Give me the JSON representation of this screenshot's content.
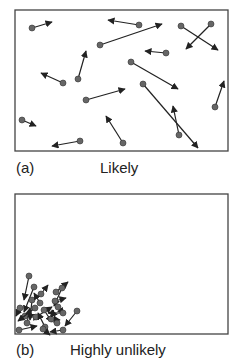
{
  "panels": [
    {
      "id": "a",
      "tag": "(a)",
      "caption": "Likely",
      "box": {
        "x": 15,
        "y": 10,
        "w": 213,
        "h": 141
      },
      "particles": [
        {
          "x": 32,
          "y": 28,
          "tx": 52,
          "ty": 22
        },
        {
          "x": 139,
          "y": 25,
          "tx": 108,
          "ty": 20
        },
        {
          "x": 100,
          "y": 45,
          "tx": 162,
          "ty": 24
        },
        {
          "x": 181,
          "y": 26,
          "tx": 218,
          "ty": 50
        },
        {
          "x": 211,
          "y": 24,
          "tx": 186,
          "ty": 49
        },
        {
          "x": 166,
          "y": 53,
          "tx": 145,
          "ty": 51
        },
        {
          "x": 78,
          "y": 79,
          "tx": 86,
          "ty": 51
        },
        {
          "x": 63,
          "y": 83,
          "tx": 41,
          "ty": 73
        },
        {
          "x": 131,
          "y": 62,
          "tx": 178,
          "ty": 89
        },
        {
          "x": 143,
          "y": 84,
          "tx": 198,
          "ty": 148
        },
        {
          "x": 86,
          "y": 100,
          "tx": 125,
          "ty": 89
        },
        {
          "x": 215,
          "y": 107,
          "tx": 224,
          "ty": 81
        },
        {
          "x": 22,
          "y": 120,
          "tx": 36,
          "ty": 126
        },
        {
          "x": 123,
          "y": 143,
          "tx": 106,
          "ty": 116
        },
        {
          "x": 179,
          "y": 135,
          "tx": 173,
          "ty": 106
        },
        {
          "x": 80,
          "y": 141,
          "tx": 52,
          "ty": 146
        }
      ]
    },
    {
      "id": "b",
      "tag": "(b)",
      "caption": "Highly unlikely",
      "box": {
        "x": 15,
        "y": 194,
        "w": 213,
        "h": 140
      },
      "particles": [
        {
          "x": 29,
          "y": 276,
          "tx": 24,
          "ty": 300
        },
        {
          "x": 34,
          "y": 287,
          "tx": 24,
          "ty": 312
        },
        {
          "x": 41,
          "y": 294,
          "tx": 48,
          "ty": 285
        },
        {
          "x": 32,
          "y": 300,
          "tx": 30,
          "ty": 320
        },
        {
          "x": 56,
          "y": 292,
          "tx": 68,
          "ty": 282
        },
        {
          "x": 62,
          "y": 288,
          "tx": 54,
          "ty": 306
        },
        {
          "x": 55,
          "y": 301,
          "tx": 66,
          "ty": 298
        },
        {
          "x": 20,
          "y": 308,
          "tx": 16,
          "ty": 316
        },
        {
          "x": 25,
          "y": 316,
          "tx": 40,
          "ty": 318
        },
        {
          "x": 35,
          "y": 308,
          "tx": 18,
          "ty": 321
        },
        {
          "x": 36,
          "y": 317,
          "tx": 52,
          "ty": 307
        },
        {
          "x": 44,
          "y": 310,
          "tx": 52,
          "ty": 322
        },
        {
          "x": 58,
          "y": 307,
          "tx": 64,
          "ty": 314
        },
        {
          "x": 51,
          "y": 319,
          "tx": 60,
          "ty": 320
        },
        {
          "x": 63,
          "y": 313,
          "tx": 48,
          "ty": 313
        },
        {
          "x": 77,
          "y": 311,
          "tx": 65,
          "ty": 326
        },
        {
          "x": 27,
          "y": 323,
          "tx": 30,
          "ty": 308
        },
        {
          "x": 45,
          "y": 327,
          "tx": 38,
          "ty": 313
        },
        {
          "x": 57,
          "y": 323,
          "tx": 52,
          "ty": 310
        },
        {
          "x": 19,
          "y": 330,
          "tx": 37,
          "ty": 326
        },
        {
          "x": 43,
          "y": 329,
          "tx": 50,
          "ty": 335
        },
        {
          "x": 63,
          "y": 330,
          "tx": 50,
          "ty": 332
        },
        {
          "x": 40,
          "y": 303,
          "tx": 34,
          "ty": 293
        }
      ]
    }
  ],
  "colors": {
    "particle": "#666666",
    "arrow": "#222222",
    "border": "#444444"
  }
}
